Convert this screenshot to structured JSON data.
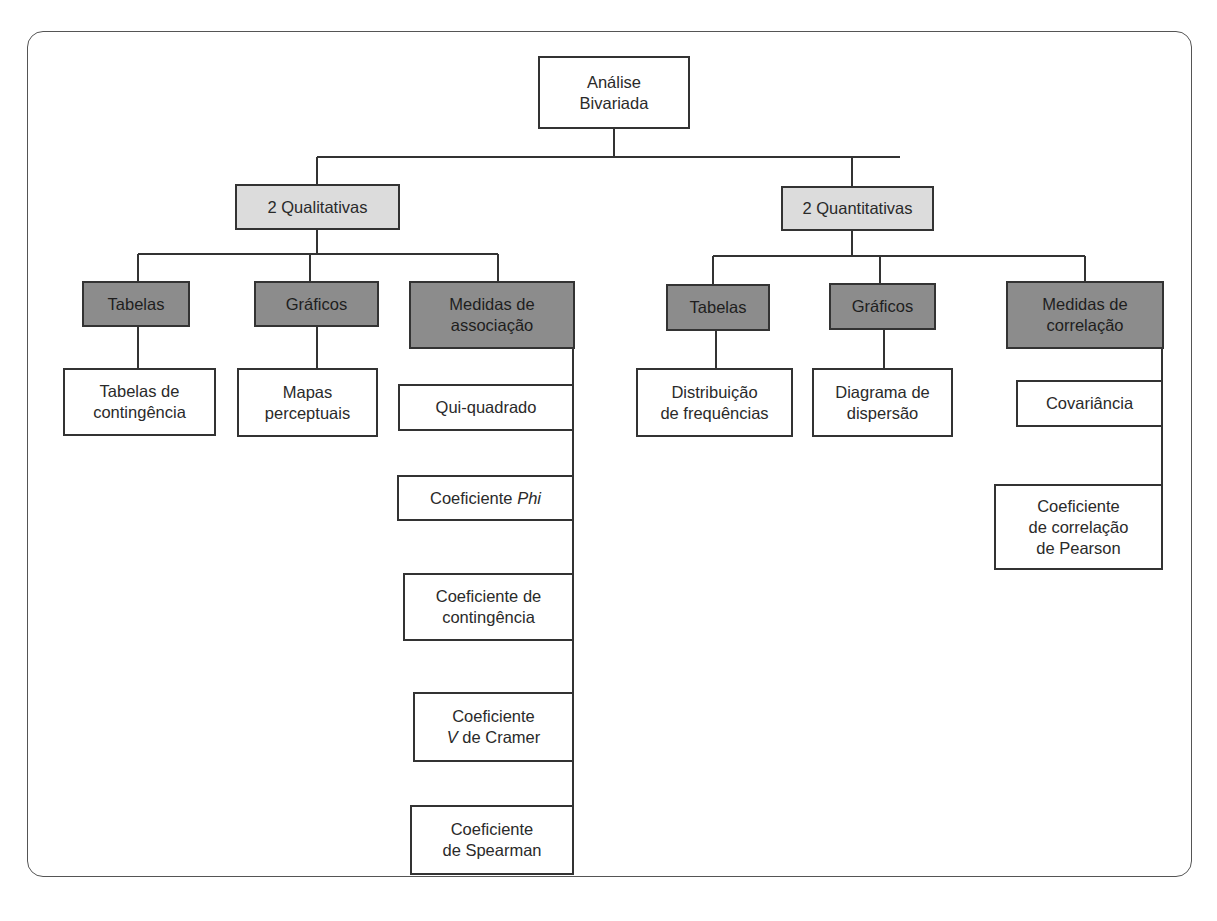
{
  "diagram": {
    "root": {
      "label": "Análise\nBivariada"
    },
    "left": {
      "label": "2 Qualitativas",
      "tables": {
        "label": "Tabelas",
        "child": "Tabelas de\ncontingência"
      },
      "charts": {
        "label": "Gráficos",
        "child": "Mapas\nperceptuais"
      },
      "measures": {
        "label": "Medidas de\nassociação",
        "items": [
          {
            "label": "Qui-quadrado"
          },
          {
            "label": "Coeficiente ",
            "italic": "Phi"
          },
          {
            "label": "Coeficiente de\ncontingência"
          },
          {
            "label_line1": "Coeficiente",
            "italic": "V",
            "label_rest": " de Cramer"
          },
          {
            "label": "Coeficiente\nde Spearman"
          }
        ]
      }
    },
    "right": {
      "label": "2 Quantitativas",
      "tables": {
        "label": "Tabelas",
        "child": "Distribuição\nde frequências"
      },
      "charts": {
        "label": "Gráficos",
        "child": "Diagrama de\ndispersão"
      },
      "measures": {
        "label": "Medidas de\ncorrelação",
        "items": [
          {
            "label": "Covariância"
          },
          {
            "label": "Coeficiente\nde correlação\nde Pearson"
          }
        ]
      }
    },
    "colors": {
      "level1_fill": "#dcdcdc",
      "level2_fill": "#8c8c8c",
      "leaf_fill": "#ffffff",
      "stroke": "#333333"
    }
  }
}
